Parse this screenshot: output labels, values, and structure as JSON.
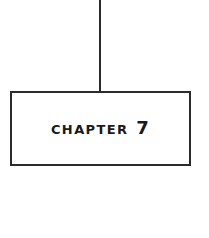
{
  "canvas": {
    "width": 209,
    "height": 238,
    "background_color": "#ffffff"
  },
  "diagram": {
    "type": "flowchart-node-with-connector",
    "stroke_color": "#2b2b2b",
    "fill_color": "#ffffff",
    "connector": {
      "orientation": "vertical",
      "description": "vertical line from top of image to top edge of chapter box"
    },
    "node": {
      "shape": "rectangle",
      "label": "Chapter 7",
      "chapter_number": "7",
      "text_style": "bold small-caps"
    }
  }
}
